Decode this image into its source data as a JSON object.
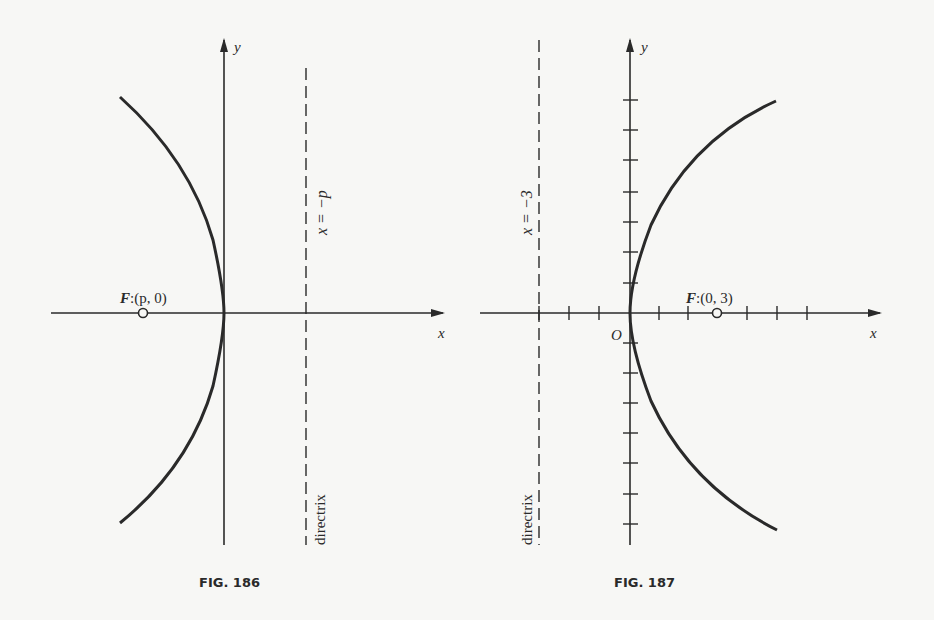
{
  "figures": [
    {
      "caption": "FIG. 186",
      "x_axis_label": "x",
      "y_axis_label": "y",
      "focus_label_var": "F",
      "focus_label_coords": ":(p, 0)",
      "directrix_equation": "x = −p",
      "directrix_label": "directrix"
    },
    {
      "caption": "FIG. 187",
      "x_axis_label": "x",
      "y_axis_label": "y",
      "origin_label": "O",
      "focus_label_var": "F",
      "focus_label_coords": ":(0, 3)",
      "directrix_equation": "x = −3",
      "directrix_label": "directrix"
    }
  ],
  "colors": {
    "ink": "#2a2a2a",
    "paper": "#f7f7f5"
  }
}
